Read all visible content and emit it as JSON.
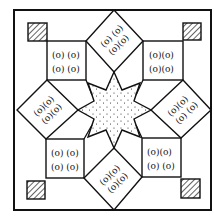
{
  "figure": {
    "stroke_color": "#111111",
    "background": "#ffffff",
    "center_star": {
      "name": "stippled-eight-point-star",
      "fill_pattern": "dots"
    },
    "corner_squares": {
      "count": 4,
      "fill_pattern": "diagonal-hatch"
    },
    "motif_squares": [
      {
        "position": "top-left",
        "row1": "(o) (o)",
        "row2": "(o) (o)"
      },
      {
        "position": "top-right",
        "row1": "(o)(o)",
        "row2": "(o)(o)"
      },
      {
        "position": "bottom-left",
        "row1": "(o) (o)",
        "row2": "(o) (o)"
      },
      {
        "position": "bottom-right",
        "row1": "(o)(o)",
        "row2": "(o) (o)"
      }
    ],
    "motif_diamonds": [
      {
        "position": "top",
        "row1": "(o) (o)",
        "row2": "(o)(o)"
      },
      {
        "position": "left",
        "row1": "(o)(o)",
        "row2": "(o)(o)"
      },
      {
        "position": "right",
        "row1": "(o)(o)",
        "row2": "(o) (o)"
      },
      {
        "position": "bottom",
        "row1": "(o)(o)",
        "row2": "(o)(o)"
      }
    ]
  }
}
